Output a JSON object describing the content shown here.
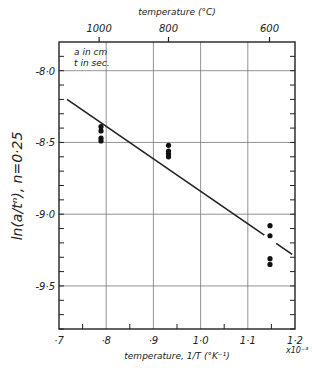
{
  "chart_data": {
    "type": "scatter",
    "title": "",
    "xlabel": "temperature, 1/T (°K⁻¹)",
    "x_multiplier": "x10⁻³",
    "ylabel": "ln(a/tⁿ),  n=0·25",
    "top_xlabel": "temperature (°C)",
    "xlim": [
      0.7,
      1.2
    ],
    "ylim": [
      -9.8,
      -7.8
    ],
    "x_ticks": [
      "·7",
      "·8",
      "·9",
      "1·0",
      "1·1",
      "1·2"
    ],
    "y_ticks": [
      "-8·0",
      "-8·5",
      "-9·0",
      "-9·5"
    ],
    "top_ticks": [
      {
        "label": "1000",
        "x": 0.785
      },
      {
        "label": "800",
        "x": 0.932
      },
      {
        "label": "600",
        "x": 1.146
      }
    ],
    "annotations": [
      "a  in  cm",
      "t  in  sec."
    ],
    "grid": true,
    "series": [
      {
        "name": "data",
        "points": [
          [
            0.789,
            -8.39
          ],
          [
            0.789,
            -8.42
          ],
          [
            0.789,
            -8.47
          ],
          [
            0.789,
            -8.49
          ],
          [
            0.932,
            -8.52
          ],
          [
            0.932,
            -8.56
          ],
          [
            0.932,
            -8.58
          ],
          [
            0.932,
            -8.6
          ],
          [
            1.147,
            -9.08
          ],
          [
            1.147,
            -9.15
          ],
          [
            1.147,
            -9.31
          ],
          [
            1.147,
            -9.35
          ]
        ]
      },
      {
        "name": "fit line",
        "type": "line",
        "points": [
          [
            0.717,
            -8.2
          ],
          [
            1.194,
            -9.28
          ]
        ]
      }
    ]
  }
}
